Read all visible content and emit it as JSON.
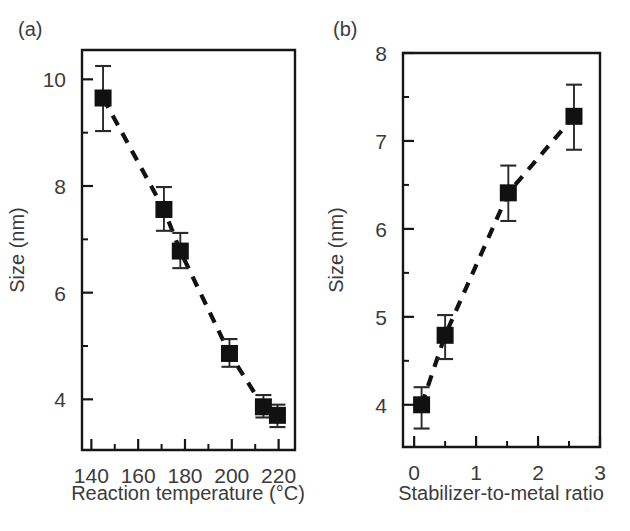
{
  "figure": {
    "background": "#ffffff",
    "ink_color": "#161616",
    "marker_color": "#111111",
    "text_color": "#3b3b3b"
  },
  "panels": [
    {
      "letter": "(a)",
      "letter_name": "panel-letter-a"
    },
    {
      "letter": "(b)",
      "letter_name": "panel-letter-b"
    }
  ],
  "chart_data": [
    {
      "type": "scatter",
      "panel": "(a)",
      "title": "",
      "xlabel": "Reaction temperature (°C)",
      "ylabel": "Size (nm)",
      "xlim": [
        136,
        227
      ],
      "ylim": [
        3.05,
        10.55
      ],
      "xticks": [
        140,
        160,
        180,
        200,
        220
      ],
      "xticklabels": [
        "140",
        "160",
        "180",
        "200",
        "220"
      ],
      "xminorticks": [
        150,
        170,
        190,
        210
      ],
      "yticks": [
        4,
        6,
        8,
        10
      ],
      "yticklabels": [
        "4",
        "6",
        "8",
        "10"
      ],
      "yminorticks": [
        5,
        7,
        9
      ],
      "grid": false,
      "legend": "none",
      "line_style": "dashed",
      "marker": "filled-square",
      "x": [
        145,
        171,
        178,
        199,
        213.5,
        219.5
      ],
      "y": [
        9.65,
        7.56,
        6.78,
        4.86,
        3.86,
        3.7
      ],
      "yerr_lower": [
        0.62,
        0.4,
        0.32,
        0.25,
        0.2,
        0.22
      ],
      "yerr_upper": [
        0.6,
        0.42,
        0.34,
        0.27,
        0.22,
        0.2
      ]
    },
    {
      "type": "scatter",
      "panel": "(b)",
      "title": "",
      "xlabel": "Stabilizer-to-metal ratio",
      "ylabel": "Size (nm)",
      "xlim": [
        -0.18,
        3.0
      ],
      "ylim": [
        3.52,
        8.0
      ],
      "xticks": [
        0,
        1,
        2,
        3
      ],
      "xticklabels": [
        "0",
        "1",
        "2",
        "3"
      ],
      "xminorticks": [
        0.5,
        1.5,
        2.5
      ],
      "yticks": [
        4,
        5,
        6,
        7,
        8
      ],
      "yticklabels": [
        "4",
        "5",
        "6",
        "7",
        "8"
      ],
      "yminorticks": [
        4.5,
        5.5,
        6.5,
        7.5
      ],
      "grid": false,
      "legend": "none",
      "line_style": "dashed",
      "marker": "filled-square",
      "x": [
        0.12,
        0.5,
        1.52,
        2.58
      ],
      "y": [
        4.0,
        4.79,
        6.41,
        7.28
      ],
      "yerr_lower": [
        0.27,
        0.27,
        0.32,
        0.38
      ],
      "yerr_upper": [
        0.2,
        0.23,
        0.31,
        0.36
      ]
    }
  ]
}
